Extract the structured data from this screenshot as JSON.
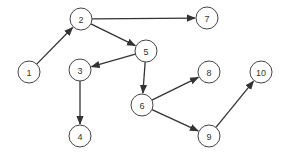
{
  "diagram": {
    "type": "directed-graph",
    "node_radius": 11,
    "colors": {
      "node_stroke": "#444444",
      "edge": "#333333",
      "edge_accent": "#3a3aa8",
      "background": "#ffffff"
    },
    "nodes": [
      {
        "id": "1",
        "label": "1",
        "x": 29,
        "y": 72
      },
      {
        "id": "2",
        "label": "2",
        "x": 81,
        "y": 19
      },
      {
        "id": "3",
        "label": "3",
        "x": 80,
        "y": 70
      },
      {
        "id": "4",
        "label": "4",
        "x": 80,
        "y": 136
      },
      {
        "id": "5",
        "label": "5",
        "x": 146,
        "y": 51
      },
      {
        "id": "6",
        "label": "6",
        "x": 142,
        "y": 105
      },
      {
        "id": "7",
        "label": "7",
        "x": 207,
        "y": 18
      },
      {
        "id": "8",
        "label": "8",
        "x": 209,
        "y": 72
      },
      {
        "id": "9",
        "label": "9",
        "x": 209,
        "y": 136
      },
      {
        "id": "10",
        "label": "10",
        "x": 261,
        "y": 72
      }
    ],
    "edges": [
      {
        "from": "1",
        "to": "2"
      },
      {
        "from": "2",
        "to": "7"
      },
      {
        "from": "2",
        "to": "5"
      },
      {
        "from": "5",
        "to": "3"
      },
      {
        "from": "5",
        "to": "6"
      },
      {
        "from": "3",
        "to": "4"
      },
      {
        "from": "6",
        "to": "8"
      },
      {
        "from": "6",
        "to": "9"
      },
      {
        "from": "9",
        "to": "10"
      }
    ]
  }
}
